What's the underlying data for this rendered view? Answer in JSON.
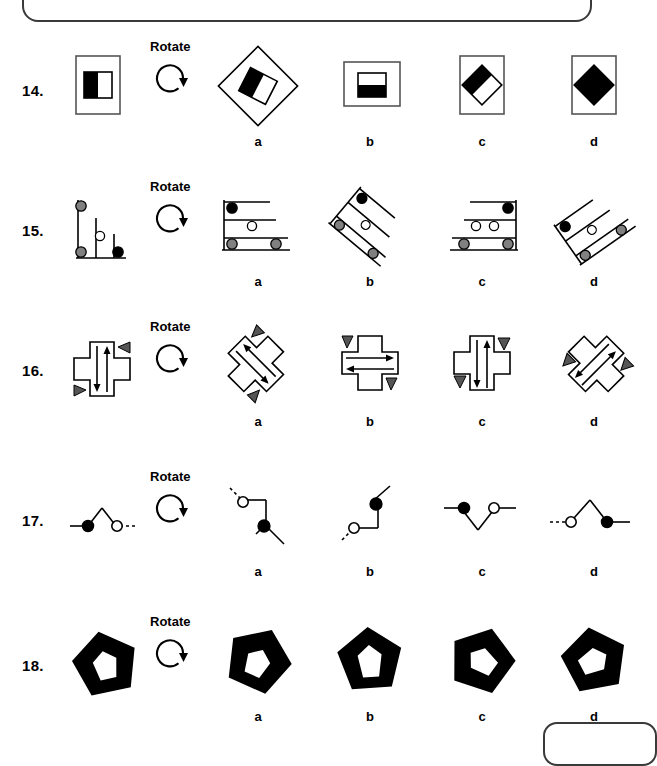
{
  "page": {
    "type": "spatial-reasoning-test-page",
    "instruction_label": "Rotate",
    "option_labels": [
      "a",
      "b",
      "c",
      "d"
    ],
    "top_box": "partial-rounded-box",
    "bottom_box": "partial-rounded-box"
  },
  "questions": [
    {
      "number": "14.",
      "instruction": "Rotate",
      "prompt_figure": "portrait-rectangle-with-half-black-square",
      "options": [
        {
          "label": "a",
          "figure": "diamond-outline-with-rotated-half-black-square"
        },
        {
          "label": "b",
          "figure": "landscape-rectangle-with-half-black-horizontal-square"
        },
        {
          "label": "c",
          "figure": "portrait-rectangle-with-rotated-half-black-diamond"
        },
        {
          "label": "d",
          "figure": "portrait-rectangle-with-solid-black-diamond"
        }
      ]
    },
    {
      "number": "15.",
      "instruction": "Rotate",
      "prompt_figure": "vertical-bars-with-gray-white-black-circles",
      "options": [
        {
          "label": "a",
          "figure": "horizontal-bars-with-black-white-gray-circles"
        },
        {
          "label": "b",
          "figure": "diagonal-bars-rotated-45-deg-left"
        },
        {
          "label": "c",
          "figure": "horizontal-bars-mirrored-right"
        },
        {
          "label": "d",
          "figure": "diagonal-bars-rotated-right"
        }
      ]
    },
    {
      "number": "16.",
      "instruction": "Rotate",
      "prompt_figure": "cross-with-vertical-arrows-and-triangles",
      "options": [
        {
          "label": "a",
          "figure": "rotated-cross-with-diagonal-arrows"
        },
        {
          "label": "b",
          "figure": "cross-with-horizontal-arrows"
        },
        {
          "label": "c",
          "figure": "cross-with-vertical-arrows-mirrored"
        },
        {
          "label": "d",
          "figure": "rotated-cross-with-diagonal-arrows-alt"
        }
      ]
    },
    {
      "number": "17.",
      "instruction": "Rotate",
      "prompt_figure": "peak-line-with-black-and-white-circles",
      "options": [
        {
          "label": "a",
          "figure": "vertical-bend-white-top-black-bottom"
        },
        {
          "label": "b",
          "figure": "vertical-bend-black-top-white-bottom"
        },
        {
          "label": "c",
          "figure": "valley-line-black-left-white-right"
        },
        {
          "label": "d",
          "figure": "peak-line-white-left-black-right"
        }
      ]
    },
    {
      "number": "18.",
      "instruction": "Rotate",
      "prompt_figure": "black-pentagon-with-white-pentagon-hole",
      "options": [
        {
          "label": "a",
          "figure": "black-pentagon-rotated-hole-center"
        },
        {
          "label": "b",
          "figure": "black-pentagon-hole-upright"
        },
        {
          "label": "c",
          "figure": "black-pentagon-rotated-left-hole"
        },
        {
          "label": "d",
          "figure": "black-pentagon-rotated-right-hole"
        }
      ]
    }
  ],
  "colors": {
    "stroke": "#000000",
    "fill_black": "#000000",
    "fill_gray": "#808080",
    "fill_white": "#ffffff",
    "box_border": "#3a3a3a"
  }
}
